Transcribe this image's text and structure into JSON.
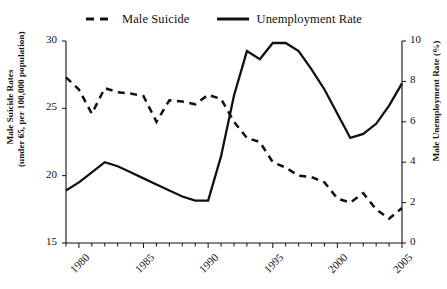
{
  "chart_data": {
    "type": "line",
    "title": "",
    "xlabel": "",
    "ylabel": "Male Suicide Rates (under 65, per 100,000 population)",
    "y2label": "Male Unemployment Rate (%)",
    "grid": false,
    "legend_position": "top-center",
    "xlim": [
      1979,
      2005
    ],
    "ylim": [
      15,
      30
    ],
    "y2lim": [
      0,
      10
    ],
    "x": [
      1979,
      1980,
      1981,
      1982,
      1983,
      1984,
      1985,
      1986,
      1987,
      1988,
      1989,
      1990,
      1991,
      1992,
      1993,
      1994,
      1995,
      1996,
      1997,
      1998,
      1999,
      2000,
      2001,
      2002,
      2003,
      2004,
      2005
    ],
    "xticks": [
      1980,
      1985,
      1990,
      1995,
      2000,
      2005
    ],
    "xticklabels": [
      "1980",
      "1985",
      "1990",
      "1995",
      "2000",
      "2005"
    ],
    "yticks": [
      15,
      20,
      25,
      30
    ],
    "yticklabels": [
      "15",
      "20",
      "25",
      "30"
    ],
    "y2ticks": [
      0,
      2,
      4,
      6,
      8,
      10
    ],
    "y2ticklabels": [
      "0",
      "2",
      "4",
      "6",
      "8",
      "10"
    ],
    "series": [
      {
        "name": "Male Suicide",
        "axis": "left",
        "style": "dashed",
        "color": "#111111",
        "values": [
          27.3,
          26.4,
          24.6,
          26.5,
          26.2,
          26.1,
          25.9,
          24.0,
          25.6,
          25.5,
          25.3,
          26.0,
          25.7,
          24.0,
          22.8,
          22.5,
          21.0,
          20.6,
          20.0,
          19.9,
          19.5,
          18.3,
          18.0,
          18.7,
          17.5,
          16.8,
          17.6
        ]
      },
      {
        "name": "Unemployment Rate",
        "axis": "right",
        "style": "solid",
        "color": "#111111",
        "values": [
          2.6,
          3.0,
          3.5,
          4.0,
          3.8,
          3.5,
          3.2,
          2.9,
          2.6,
          2.3,
          2.1,
          2.1,
          4.3,
          7.3,
          9.5,
          9.1,
          9.9,
          9.9,
          9.5,
          8.6,
          7.6,
          6.4,
          5.2,
          5.4,
          5.9,
          6.8,
          7.9
        ]
      }
    ]
  },
  "legend": {
    "items": [
      {
        "label": "Male Suicide",
        "style": "dashed"
      },
      {
        "label": "Unemployment Rate",
        "style": "solid"
      }
    ]
  },
  "axes": {
    "left_title": "Male Suicide Rates\n(under 65, per 100,000 population)",
    "left_title_line1": "Male Suicide Rates",
    "left_title_line2": "(under 65, per 100,000 population)",
    "right_title": "Male Unemployment Rate (%)"
  }
}
